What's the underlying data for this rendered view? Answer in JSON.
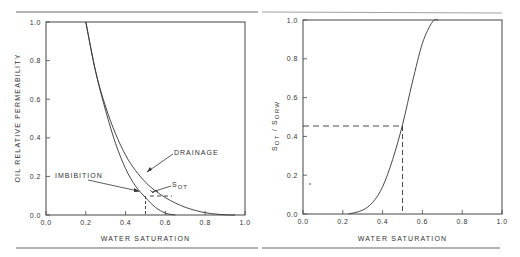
{
  "chart_data": [
    {
      "type": "line",
      "title": "",
      "xlabel": "WATER SATURATION",
      "ylabel": "OIL RELATIVE PERMEABILITY",
      "xlim": [
        0.0,
        1.0
      ],
      "ylim": [
        0.0,
        1.0
      ],
      "xticks": [
        "0.0",
        "0.2",
        "0.4",
        "0.6",
        "0.8",
        "1.0"
      ],
      "yticks": [
        "0.0",
        "0.2",
        "0.4",
        "0.6",
        "0.8",
        "1.0"
      ],
      "grid": false,
      "series": [
        {
          "name": "DRAINAGE",
          "x": [
            0.2,
            0.25,
            0.3,
            0.35,
            0.4,
            0.45,
            0.5,
            0.55,
            0.6,
            0.65,
            0.7,
            0.75,
            0.8,
            0.85,
            0.9,
            0.95
          ],
          "y": [
            1.0,
            0.74,
            0.56,
            0.42,
            0.31,
            0.23,
            0.17,
            0.125,
            0.09,
            0.062,
            0.04,
            0.024,
            0.012,
            0.005,
            0.001,
            0.0
          ]
        },
        {
          "name": "IMBIBITION",
          "x": [
            0.2,
            0.25,
            0.3,
            0.35,
            0.4,
            0.45,
            0.5,
            0.55,
            0.6,
            0.65
          ],
          "y": [
            1.0,
            0.74,
            0.54,
            0.37,
            0.24,
            0.15,
            0.09,
            0.04,
            0.01,
            0.0
          ]
        }
      ],
      "annotations": [
        {
          "text": "DRAINAGE",
          "arrow_to": [
            0.5,
            0.22
          ]
        },
        {
          "text": "IMBIBITION",
          "arrow_to": [
            0.47,
            0.13
          ]
        },
        {
          "text": "SOT",
          "marker": [
            0.5,
            0.1
          ],
          "dashed_from": [
            0.5,
            0.0
          ],
          "dashed_to": [
            0.63,
            0.1
          ]
        }
      ]
    },
    {
      "type": "line",
      "title": "",
      "xlabel": "WATER SATURATION",
      "ylabel": "SOT / SORW",
      "xlim": [
        0.0,
        1.0
      ],
      "ylim": [
        0.0,
        1.0
      ],
      "xticks": [
        "0.0",
        "0.2",
        "0.4",
        "0.6",
        "0.8",
        "1.0"
      ],
      "yticks": [
        "0.0",
        "0.2",
        "0.4",
        "0.6",
        "0.8",
        "1.0"
      ],
      "grid": false,
      "series": [
        {
          "name": "SOT/SORW",
          "x": [
            0.23,
            0.3,
            0.35,
            0.4,
            0.45,
            0.5,
            0.55,
            0.6,
            0.65,
            0.68
          ],
          "y": [
            0.0,
            0.02,
            0.06,
            0.14,
            0.28,
            0.46,
            0.68,
            0.88,
            0.99,
            1.0
          ]
        }
      ],
      "annotations": [
        {
          "text": "dashed guide",
          "point": [
            0.5,
            0.46
          ]
        }
      ]
    }
  ],
  "left": {
    "xlabel": "WATER SATURATION",
    "ylabel": "OIL RELATIVE PERMEABILITY",
    "ticks": [
      "0.0",
      "0.2",
      "0.4",
      "0.6",
      "0.8",
      "1.0"
    ],
    "drainage_label": "DRAINAGE",
    "imbibition_label": "IMBIBITION",
    "sot_label": "S",
    "sot_sub": "OT"
  },
  "right": {
    "xlabel": "WATER SATURATION",
    "ylabel_s1": "S",
    "ylabel_sub1": "OT",
    "ylabel_sep": " / ",
    "ylabel_s2": "S",
    "ylabel_sub2": "ORW",
    "ticks": [
      "0.0",
      "0.2",
      "0.4",
      "0.6",
      "0.8",
      "1.0"
    ]
  }
}
